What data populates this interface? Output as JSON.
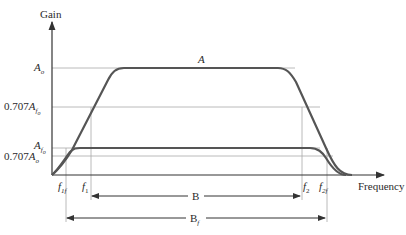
{
  "diagram": {
    "axes": {
      "y_label": "Gain",
      "x_label": "Frequency"
    },
    "y_levels": {
      "A_o": {
        "main": "A",
        "sub": "o"
      },
      "p707_A_fo": {
        "prefix": "0.707",
        "main": "A",
        "sub": "f",
        "subsub": "o"
      },
      "A_fo": {
        "main": "A",
        "sub": "f",
        "subsub": "o"
      },
      "p707_A_o": {
        "prefix": "0.707",
        "main": "A",
        "sub": "o"
      }
    },
    "x_marks": {
      "f1f": {
        "main": "f",
        "sub": "1f"
      },
      "f1": {
        "main": "f",
        "sub": "1"
      },
      "f2": {
        "main": "f",
        "sub": "2"
      },
      "f2f": {
        "main": "f",
        "sub": "2f"
      }
    },
    "curves": {
      "open_loop": {
        "label": "A"
      },
      "closed_loop": {
        "label": ""
      }
    },
    "bandwidths": {
      "B": {
        "main": "B",
        "sub": ""
      },
      "Bf": {
        "main": "B",
        "sub": "f"
      }
    },
    "colors": {
      "curve": "#555555",
      "axis": "#333333",
      "guide": "#a8a8a8",
      "text": "#2a2a2a"
    }
  }
}
